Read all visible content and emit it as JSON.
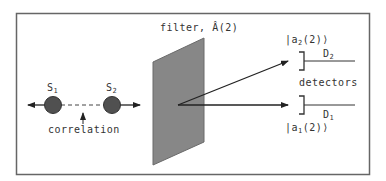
{
  "diagram": {
    "type": "quantum-correlation-filter-setup",
    "sources": [
      {
        "id": "S1",
        "label": "S",
        "subscript": "1"
      },
      {
        "id": "S2",
        "label": "S",
        "subscript": "2"
      }
    ],
    "correlation_label": "correlation",
    "filter": {
      "label": "filter, ",
      "operator": "Â(2)"
    },
    "output_states": [
      {
        "id": "a2",
        "prefix": "|a",
        "subscript": "2",
        "suffix": "(2)⟩"
      },
      {
        "id": "a1",
        "prefix": "|a",
        "subscript": "1",
        "suffix": "(2)⟩"
      }
    ],
    "detectors": [
      {
        "id": "D2",
        "label": "D",
        "subscript": "2"
      },
      {
        "id": "D1",
        "label": "D",
        "subscript": "1"
      }
    ],
    "detectors_label": "detectors",
    "colors": {
      "border": "#666666",
      "filter_fill": "#808080",
      "source_fill": "#505050",
      "line": "#222222",
      "text": "#333333"
    }
  }
}
